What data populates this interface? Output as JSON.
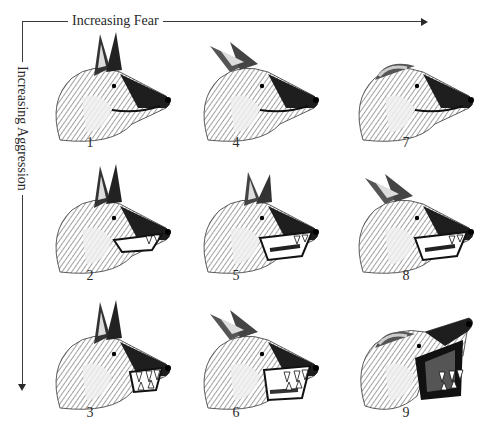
{
  "axes": {
    "horizontal": {
      "label": "Increasing Fear",
      "direction": "right"
    },
    "vertical": {
      "label": "Increasing Aggression",
      "direction": "down"
    }
  },
  "grid": {
    "columns": 3,
    "rows": 3,
    "cells": [
      {
        "id": "1",
        "label": "1",
        "col": 0,
        "row": 0,
        "ears": "erect",
        "mouth": "closed",
        "teeth": "none"
      },
      {
        "id": "4",
        "label": "4",
        "col": 1,
        "row": 0,
        "ears": "back",
        "mouth": "closed",
        "teeth": "none"
      },
      {
        "id": "7",
        "label": "7",
        "col": 2,
        "row": 0,
        "ears": "flat",
        "mouth": "closed",
        "teeth": "none"
      },
      {
        "id": "2",
        "label": "2",
        "col": 0,
        "row": 1,
        "ears": "erect",
        "mouth": "slightly-open",
        "teeth": "some"
      },
      {
        "id": "5",
        "label": "5",
        "col": 1,
        "row": 1,
        "ears": "partly-back",
        "mouth": "open",
        "teeth": "some"
      },
      {
        "id": "8",
        "label": "8",
        "col": 2,
        "row": 1,
        "ears": "back",
        "mouth": "open",
        "teeth": "some"
      },
      {
        "id": "3",
        "label": "3",
        "col": 0,
        "row": 2,
        "ears": "erect",
        "mouth": "snarl",
        "teeth": "bared"
      },
      {
        "id": "6",
        "label": "6",
        "col": 1,
        "row": 2,
        "ears": "back",
        "mouth": "wide-snarl",
        "teeth": "bared"
      },
      {
        "id": "9",
        "label": "9",
        "col": 2,
        "row": 2,
        "ears": "flat",
        "mouth": "gaping-snarl",
        "teeth": "fully-bared"
      }
    ]
  },
  "colors": {
    "ink": "#2a2a2a",
    "background": "#ffffff"
  }
}
